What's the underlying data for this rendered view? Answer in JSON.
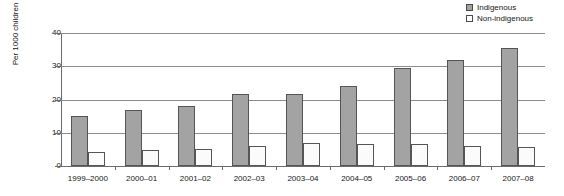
{
  "chart_data": {
    "type": "bar",
    "title": "",
    "xlabel": "",
    "ylabel": "Per 1000 children",
    "ylim": [
      0,
      40
    ],
    "yticks": [
      0,
      10,
      20,
      30,
      40
    ],
    "grid": true,
    "legend_position": "top-right",
    "categories": [
      "1999–2000",
      "2000–01",
      "2001–02",
      "2002–03",
      "2003–04",
      "2004–05",
      "2005–06",
      "2006–07",
      "2007–08"
    ],
    "series": [
      {
        "name": "Indigenous",
        "color": "#a3a3a3",
        "values": [
          15.0,
          16.8,
          18.0,
          21.8,
          21.8,
          24.0,
          29.5,
          32.0,
          35.5
        ]
      },
      {
        "name": "Non-indigenous",
        "color": "#fbfbfb",
        "values": [
          4.2,
          4.8,
          5.2,
          6.0,
          7.0,
          6.6,
          6.6,
          6.0,
          5.6
        ]
      }
    ]
  },
  "legend": {
    "items": [
      {
        "label": "Indigenous",
        "swatch": "indigenous"
      },
      {
        "label": "Non-indigenous",
        "swatch": "nonindigenous"
      }
    ]
  },
  "axis": {
    "y_title": "Per 1000 children",
    "y_tick_labels": [
      "40",
      "30",
      "20",
      "10",
      "0"
    ]
  },
  "colors": {
    "indigenous_fill": "#a3a3a3",
    "nonindigenous_fill": "#fbfbfb",
    "bar_border": "#555555",
    "gridline": "#8c8c8c",
    "axis": "#6b6b6b",
    "text": "#161616",
    "background": "#ffffff"
  }
}
